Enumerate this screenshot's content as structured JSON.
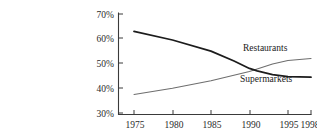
{
  "caption": {
    "fragment": "KZ  1-13      Share of Food Dollar ..."
  },
  "chart_data": {
    "type": "line",
    "title": "",
    "subtitle": "",
    "xlabel": "",
    "ylabel": "",
    "x": [
      1975,
      1980,
      1985,
      1990,
      1995,
      1998
    ],
    "xtick_labels": [
      "1975",
      "1980",
      "1985",
      "1990",
      "1995",
      "1998"
    ],
    "ytick_labels": [
      "30%",
      "40%",
      "50%",
      "60%",
      "70%"
    ],
    "ytick_values": [
      30,
      40,
      50,
      60,
      70
    ],
    "xlim": [
      1975,
      1998
    ],
    "ylim": [
      30,
      70
    ],
    "grid": false,
    "legend_position": "inline-right",
    "annotations": [
      {
        "text": "Restaurants",
        "x": 1993.0,
        "y": 53.5
      },
      {
        "text": "Supermarkets",
        "x": 1993.0,
        "y": 41.5
      }
    ],
    "series": [
      {
        "name": "Restaurants",
        "color": "#1c1c1c",
        "points": [
          {
            "x": 1975,
            "y": 63.0
          },
          {
            "x": 1980,
            "y": 59.5
          },
          {
            "x": 1985,
            "y": 55.0
          },
          {
            "x": 1988,
            "y": 51.0
          },
          {
            "x": 1990,
            "y": 48.0
          },
          {
            "x": 1991,
            "y": 47.0
          },
          {
            "x": 1993,
            "y": 45.5
          },
          {
            "x": 1995,
            "y": 44.7
          },
          {
            "x": 1998,
            "y": 44.5
          }
        ],
        "values": [
          63.0,
          59.5,
          55.0,
          48.0,
          44.7,
          44.5
        ]
      },
      {
        "name": "Supermarkets",
        "color": "#6e6e6e",
        "points": [
          {
            "x": 1975,
            "y": 37.5
          },
          {
            "x": 1980,
            "y": 40.0
          },
          {
            "x": 1985,
            "y": 43.0
          },
          {
            "x": 1990,
            "y": 46.8
          },
          {
            "x": 1993,
            "y": 49.8
          },
          {
            "x": 1995,
            "y": 51.2
          },
          {
            "x": 1998,
            "y": 52.0
          }
        ],
        "values": [
          37.5,
          40.0,
          43.0,
          46.8,
          51.2,
          52.0
        ]
      }
    ]
  }
}
